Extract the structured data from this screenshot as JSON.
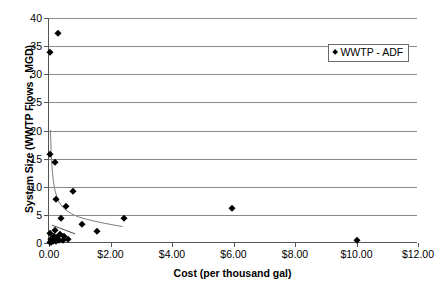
{
  "chart_data": {
    "type": "scatter",
    "title": "",
    "xlabel": "Cost (per thousand gal)",
    "ylabel": "System Size (WWTP Flows - MGD)",
    "xlim": [
      0,
      12
    ],
    "ylim": [
      0,
      40
    ],
    "grid": "horizontal",
    "legend_position": "upper-right",
    "xticks": [
      0,
      2,
      4,
      6,
      8,
      10,
      12
    ],
    "xticklabels": [
      "0.00",
      "$2.00",
      "$4.00",
      "$6.00",
      "$8.00",
      "$10.00",
      "$12.00"
    ],
    "yticks": [
      0,
      5,
      10,
      15,
      20,
      25,
      30,
      35,
      40
    ],
    "yticklabels": [
      "0",
      "5",
      "10",
      "15",
      "20",
      "25",
      "30",
      "35",
      "40"
    ],
    "series": [
      {
        "name": "WWTP - ADF",
        "marker": "diamond",
        "color": "#000000",
        "points": [
          [
            0.3,
            37.4
          ],
          [
            0.02,
            34.0
          ],
          [
            0.03,
            15.9
          ],
          [
            0.2,
            14.4
          ],
          [
            0.78,
            9.3
          ],
          [
            0.22,
            7.8
          ],
          [
            0.55,
            6.5
          ],
          [
            2.45,
            4.5
          ],
          [
            0.38,
            4.4
          ],
          [
            1.08,
            3.3
          ],
          [
            0.18,
            2.4
          ],
          [
            1.55,
            2.2
          ],
          [
            5.95,
            6.3
          ],
          [
            0.02,
            1.8
          ],
          [
            0.35,
            1.6
          ],
          [
            0.48,
            1.3
          ],
          [
            0.16,
            1.2
          ],
          [
            0.26,
            1.0
          ],
          [
            0.62,
            0.8
          ],
          [
            0.08,
            0.7
          ],
          [
            0.2,
            0.6
          ],
          [
            0.31,
            0.55
          ],
          [
            0.44,
            0.5
          ],
          [
            0.12,
            0.4
          ],
          [
            0.24,
            0.35
          ],
          [
            0.05,
            0.25
          ],
          [
            0.02,
            0.15
          ],
          [
            10.02,
            0.5
          ]
        ]
      }
    ],
    "trendlines": [
      {
        "name": "power-decay-curve",
        "style": "solid",
        "color": "#7d7d7d",
        "points": [
          [
            0.045,
            20.0
          ],
          [
            0.07,
            16.2
          ],
          [
            0.1,
            13.2
          ],
          [
            0.14,
            11.0
          ],
          [
            0.19,
            9.3
          ],
          [
            0.26,
            8.0
          ],
          [
            0.34,
            7.0
          ],
          [
            0.45,
            6.2
          ],
          [
            0.58,
            5.6
          ],
          [
            0.75,
            5.0
          ],
          [
            0.95,
            4.5
          ],
          [
            1.2,
            4.1
          ],
          [
            1.5,
            3.7
          ],
          [
            1.8,
            3.35
          ],
          [
            2.1,
            3.05
          ],
          [
            2.4,
            2.75
          ]
        ]
      },
      {
        "name": "short-linear-segment",
        "style": "solid",
        "color": "#4a4a4a",
        "points": [
          [
            0.1,
            3.0
          ],
          [
            0.85,
            1.45
          ]
        ]
      }
    ]
  },
  "legend": {
    "entries": [
      {
        "label": "WWTP - ADF",
        "marker_icon": "diamond-marker-icon"
      }
    ]
  }
}
